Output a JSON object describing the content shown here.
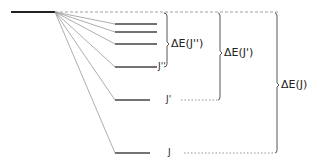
{
  "diagram": {
    "levels": [
      {
        "y": 24,
        "label": ""
      },
      {
        "y": 32,
        "label": ""
      },
      {
        "y": 44,
        "label": ""
      },
      {
        "y": 67,
        "label": "J''"
      },
      {
        "y": 100,
        "label": "J'"
      },
      {
        "y": 153,
        "label": "J"
      }
    ],
    "brackets": [
      {
        "label": "ΔE(J'')",
        "x": 167,
        "y1": 12,
        "y2": 67
      },
      {
        "label": "ΔE(J')",
        "x": 220,
        "y1": 12,
        "y2": 100
      },
      {
        "label": "ΔE(J)",
        "x": 277,
        "y1": 12,
        "y2": 153
      }
    ],
    "colors": {
      "line": "#333333",
      "fan": "#888888"
    }
  }
}
